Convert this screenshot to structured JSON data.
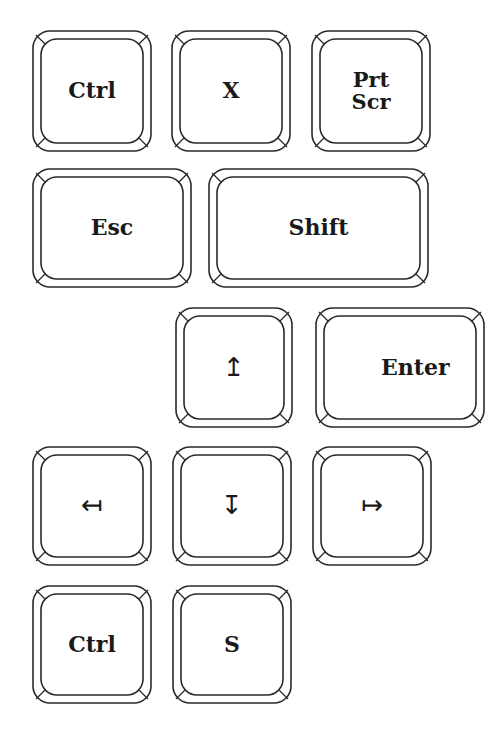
{
  "keys": [
    {
      "id": "ctrl-1",
      "label": "Ctrl",
      "x": 32,
      "y": 30,
      "w": 120,
      "h": 122
    },
    {
      "id": "x",
      "label": "X",
      "x": 171,
      "y": 30,
      "w": 120,
      "h": 122
    },
    {
      "id": "prtscr",
      "label": "Prt\nScr",
      "x": 311,
      "y": 30,
      "w": 120,
      "h": 122
    },
    {
      "id": "esc",
      "label": "Esc",
      "x": 32,
      "y": 168,
      "w": 160,
      "h": 120
    },
    {
      "id": "shift",
      "label": "Shift",
      "x": 208,
      "y": 168,
      "w": 221,
      "h": 120
    },
    {
      "id": "up",
      "label": "↥",
      "x": 175,
      "y": 307,
      "w": 118,
      "h": 121,
      "arrow": true
    },
    {
      "id": "enter",
      "label": "Enter",
      "x": 315,
      "y": 307,
      "w": 170,
      "h": 121
    },
    {
      "id": "left",
      "label": "↤",
      "x": 32,
      "y": 446,
      "w": 120,
      "h": 120,
      "arrow": true
    },
    {
      "id": "down",
      "label": "↧",
      "x": 172,
      "y": 446,
      "w": 120,
      "h": 120,
      "arrow": true
    },
    {
      "id": "right",
      "label": "↦",
      "x": 312,
      "y": 446,
      "w": 120,
      "h": 120,
      "arrow": true
    },
    {
      "id": "ctrl-2",
      "label": "Ctrl",
      "x": 32,
      "y": 585,
      "w": 120,
      "h": 119
    },
    {
      "id": "s",
      "label": "S",
      "x": 172,
      "y": 585,
      "w": 120,
      "h": 119
    }
  ],
  "style": {
    "stroke": "#2a2a2a",
    "fill": "#ffffff"
  }
}
